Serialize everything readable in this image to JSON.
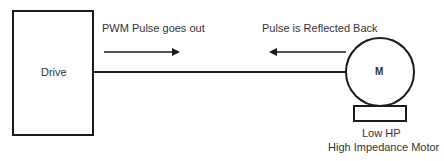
{
  "diagram": {
    "drive": {
      "label": "Drive"
    },
    "motor": {
      "label": "M",
      "caption_line1": "Low HP",
      "caption_line2": "High Impedance Motor"
    },
    "arrows": {
      "outgoing": {
        "label": "PWM Pulse goes out",
        "direction": "right"
      },
      "reflected": {
        "label": "Pulse is Reflected Back",
        "direction": "left"
      }
    },
    "colors": {
      "stroke": "#1a1a1a",
      "text": "#333333"
    }
  }
}
